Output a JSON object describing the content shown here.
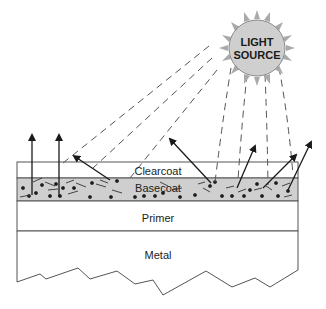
{
  "diagram": {
    "light_source": {
      "line1": "LIGHT",
      "line2": "SOURCE"
    },
    "layers": [
      {
        "name": "Clearcoat",
        "label": "Clearcoat"
      },
      {
        "name": "Basecoat",
        "label": "Basecoat"
      },
      {
        "name": "Primer",
        "label": "Primer"
      },
      {
        "name": "Metal",
        "label": "Metal"
      }
    ],
    "colors": {
      "sun_fill": "#d0d0d0",
      "basecoat_fill": "#cfcfcf",
      "line": "#2a2a2a",
      "dash": "#555555"
    }
  }
}
